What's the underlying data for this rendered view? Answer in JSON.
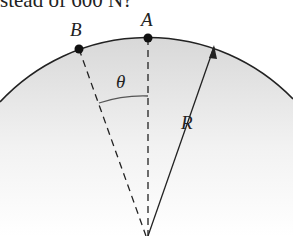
{
  "caption_fragment": "stead of 600 N?",
  "labels": {
    "point_a": "A",
    "point_b": "B",
    "angle": "θ",
    "radius": "R"
  },
  "colors": {
    "ink": "#222222",
    "fill_top": "#dcdcdc",
    "fill_bottom": "#ffffff"
  }
}
